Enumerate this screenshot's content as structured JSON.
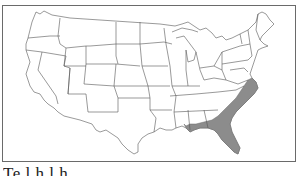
{
  "figure": {
    "type": "range-map",
    "region": "Contiguous United States",
    "shaded_region_description": "Southeastern coastal plain: eastern North Carolina, South Carolina, southern Georgia, southern Alabama, southern Mississippi/Louisiana Gulf coast, and all of Florida",
    "shaded_color": "#8c8c8c",
    "unshaded_color": "#ffffff",
    "outline_color": "#555555",
    "frame_color": "#6a6a6a"
  },
  "caption": {
    "text": "Te       l  h l  h"
  }
}
